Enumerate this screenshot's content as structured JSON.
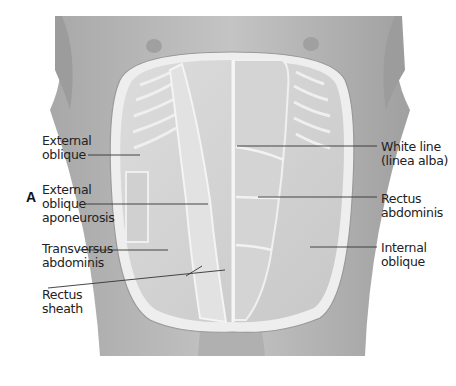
{
  "figure": {
    "panel_label": "A",
    "colors": {
      "skin": "#b8b8b8",
      "muscle": "#d8d8d8",
      "sheath_border": "#ececec",
      "leader_line": "#333333",
      "text": "#222222"
    }
  },
  "labels": {
    "external_oblique": [
      "External",
      "oblique"
    ],
    "external_oblique_aponeurosis": [
      "External",
      "oblique",
      "aponeurosis"
    ],
    "transversus_abdominis": [
      "Transversus",
      "abdominis"
    ],
    "rectus_sheath": [
      "Rectus",
      "sheath"
    ],
    "white_line": [
      "White line",
      "(linea alba)"
    ],
    "rectus_abdominis": [
      "Rectus",
      "abdominis"
    ],
    "internal_oblique": [
      "Internal",
      "oblique"
    ]
  }
}
